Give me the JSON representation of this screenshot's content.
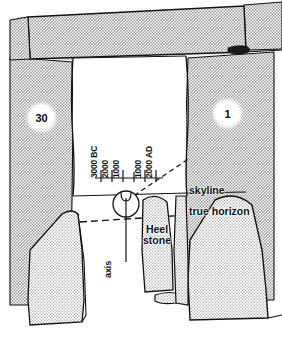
{
  "figure": {
    "stones": [
      {
        "id": "30",
        "label": "30",
        "side": "left"
      },
      {
        "id": "1",
        "label": "1",
        "side": "right"
      }
    ],
    "labels": {
      "skyline": "skyline",
      "true_horizon": "true horizon",
      "heel_stone_line1": "Heel",
      "heel_stone_line2": "stone",
      "axis": "axis"
    },
    "timeline": {
      "ticks": [
        "3000 BC",
        "2000",
        "1000",
        "",
        "1000",
        "2000 AD"
      ],
      "tick_labels": [
        "3000 BC",
        "2000",
        "1000",
        "1000",
        "2000 AD"
      ]
    },
    "colors": {
      "ink": "#111111",
      "stipple": "#8c8c8c",
      "paper": "#ffffff"
    }
  }
}
